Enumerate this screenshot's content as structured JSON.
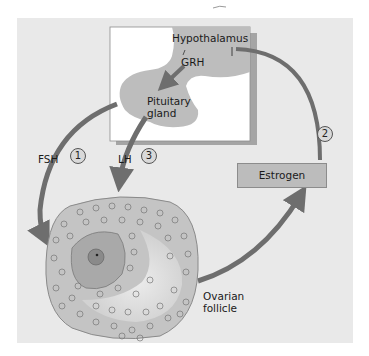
{
  "diagram": {
    "type": "hormone-feedback-loop",
    "labels": {
      "hypothalamus": "Hypothalamus",
      "grh": "GRH",
      "pituitary_line1": "Pituitary",
      "pituitary_line2": "gland",
      "fsh": "FSH",
      "lh": "LH",
      "estrogen": "Estrogen",
      "follicle_line1": "Ovarian",
      "follicle_line2": "follicle"
    },
    "steps": [
      {
        "number": "1",
        "label": "FSH"
      },
      {
        "number": "2",
        "label": "Estrogen"
      },
      {
        "number": "3",
        "label": "LH"
      }
    ],
    "colors": {
      "background_panel": "#e9e9e9",
      "brain_box": "#ffffff",
      "tissue": "#bdbdbd",
      "arrow": "#6e6e6e",
      "follicle_outer": "#c4c4c4",
      "estrogen_box": "#bcbcbc"
    }
  }
}
